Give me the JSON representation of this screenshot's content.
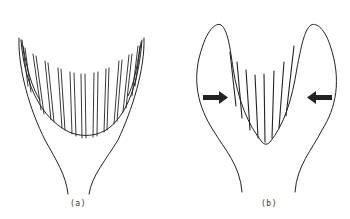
{
  "figure": {
    "panels": [
      {
        "id": "a",
        "label": "(a)",
        "description": "Open U-shaped basin with many vertical lamellae (wide, shallow curve) inside a funnel-shaped outer outline"
      },
      {
        "id": "b",
        "label": "(b)",
        "description": "Compressed, narrower V/U-shaped basin with fewer vertical lamellae between two lobed outer walls; arrows indicate inward lateral compression"
      }
    ],
    "arrows": [
      {
        "panel": "b",
        "direction": "right",
        "meaning": "compression-from-left"
      },
      {
        "panel": "b",
        "direction": "left",
        "meaning": "compression-from-right"
      }
    ],
    "colors": {
      "line": "#222222",
      "background": "#ffffff"
    }
  }
}
